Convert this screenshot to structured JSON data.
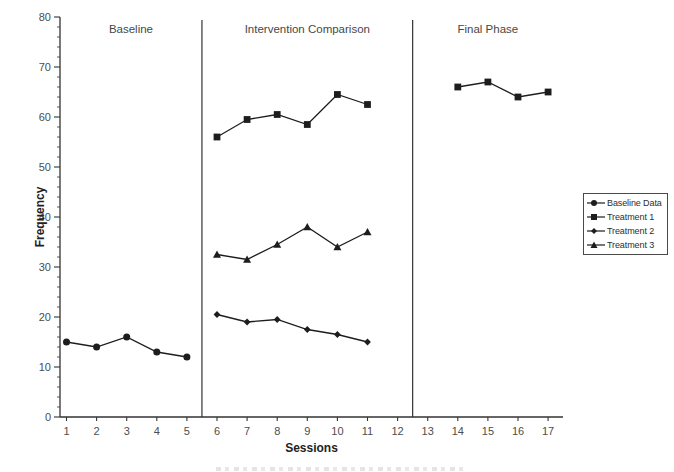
{
  "figure": {
    "background": "#ffffff",
    "ink_color": "#1d1d1d",
    "axis_color": "#333333",
    "tick_label_color": "#4d4d4d",
    "phase_label_color": "#474747",
    "axis_title_color": "#222222"
  },
  "chart_data": {
    "type": "line",
    "title": "",
    "xlabel": "Sessions",
    "ylabel": "Frequency",
    "ylim": [
      0,
      80
    ],
    "y_major_ticks": [
      0,
      10,
      20,
      30,
      40,
      50,
      60,
      70,
      80
    ],
    "y_minor_interval": 2,
    "x_ticks": [
      1,
      2,
      3,
      4,
      5,
      6,
      7,
      8,
      9,
      10,
      11,
      12,
      13,
      14,
      15,
      16,
      17
    ],
    "grid": false,
    "legend_position": "right",
    "phases": [
      {
        "label": "Baseline",
        "session_start": 1,
        "session_end": 5
      },
      {
        "label": "Intervention Comparison",
        "session_start": 6,
        "session_end": 12
      },
      {
        "label": "Final Phase",
        "session_start": 13,
        "session_end": 17
      }
    ],
    "phase_dividers_at": [
      5.5,
      12.5
    ],
    "series": [
      {
        "name": "Baseline Data",
        "marker": "circle",
        "segments": [
          {
            "x": [
              1,
              2,
              3,
              4,
              5
            ],
            "y": [
              15,
              14,
              16,
              13,
              12
            ]
          }
        ]
      },
      {
        "name": "Treatment 1",
        "marker": "square",
        "segments": [
          {
            "x": [
              6,
              7,
              8,
              9,
              10,
              11
            ],
            "y": [
              56,
              59.5,
              60.5,
              58.5,
              64.5,
              62.5
            ]
          },
          {
            "x": [
              14,
              15,
              16,
              17
            ],
            "y": [
              66,
              67,
              64,
              65
            ]
          }
        ]
      },
      {
        "name": "Treatment 2",
        "marker": "diamond",
        "segments": [
          {
            "x": [
              6,
              7,
              8,
              9,
              10,
              11
            ],
            "y": [
              20.5,
              19,
              19.5,
              17.5,
              16.5,
              15
            ]
          }
        ]
      },
      {
        "name": "Treatment 3",
        "marker": "triangle",
        "segments": [
          {
            "x": [
              6,
              7,
              8,
              9,
              10,
              11
            ],
            "y": [
              32.5,
              31.5,
              34.5,
              38,
              34,
              37
            ]
          }
        ]
      }
    ]
  }
}
